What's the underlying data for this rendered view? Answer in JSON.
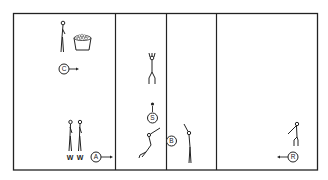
{
  "diagram": {
    "type": "court-formation",
    "zones": [
      {
        "id": "zone-1",
        "x_range": [
          13,
          115
        ]
      },
      {
        "id": "zone-2",
        "x_range": [
          115,
          166
        ]
      },
      {
        "id": "zone-3",
        "x_range": [
          166,
          216
        ]
      },
      {
        "id": "zone-4",
        "x_range": [
          216,
          318
        ]
      }
    ],
    "markers": [
      {
        "id": "C",
        "label": "C",
        "arrow": "right"
      },
      {
        "id": "A",
        "label": "A",
        "arrow": "right"
      },
      {
        "id": "S",
        "label": "S",
        "arrow": "up"
      },
      {
        "id": "B",
        "label": "B",
        "arrow": "none"
      },
      {
        "id": "R",
        "label": "R",
        "arrow": "left"
      }
    ],
    "waiting_labels": [
      "W",
      "W"
    ],
    "objects": [
      "standing-figure-by-ball-basket",
      "ball-basket",
      "waiting-figure",
      "waiting-figure",
      "jumping-figure",
      "diving-figure",
      "reaching-figure",
      "ready-figure"
    ]
  },
  "labels": {
    "c": "C",
    "a": "A",
    "s": "S",
    "b": "B",
    "r": "R",
    "w1": "W",
    "w2": "W"
  }
}
